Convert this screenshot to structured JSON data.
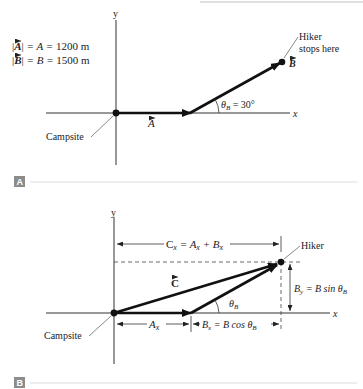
{
  "panel_a": {
    "badge": "A",
    "axis_y": "y",
    "axis_x": "x",
    "magnitude_a": "|A| = A = 1200 m",
    "magnitude_a_parts": {
      "lhs": "A",
      "mid": " = A = ",
      "value": "1200 m"
    },
    "magnitude_b_parts": {
      "lhs": "B",
      "mid": " = B = ",
      "value": "1500 m"
    },
    "vector_a_label": "A",
    "vector_b_label": "B",
    "angle_label": "θ",
    "angle_sub": "B",
    "angle_value": " = 30°",
    "origin_label": "Campsite",
    "hiker_label_line1": "Hiker",
    "hiker_label_line2": "stops here"
  },
  "panel_b": {
    "badge": "B",
    "axis_y": "y",
    "axis_x": "x",
    "vector_c_label": "C",
    "cx_label": "C",
    "cx_eq": " = A",
    "cx_plus": " + B",
    "sub_x": "x",
    "sub_y": "y",
    "ax_label": "A",
    "bx_label": "B",
    "bx_eq": " = B cos θ",
    "by_label": "B",
    "by_eq": " = B sin θ",
    "sub_b": "B",
    "angle_label": "θ",
    "origin_label": "Campsite",
    "hiker_label": "Hiker"
  },
  "colors": {
    "vector": "#111111",
    "axis": "#333333",
    "divider": "#d8d8d8",
    "badge": "#8c8c8c"
  }
}
